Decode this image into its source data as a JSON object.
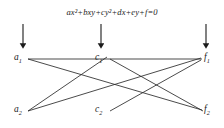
{
  "figure": {
    "equation": "ax²+bxy+cy²+dx+ey+f=0",
    "background_color": "#ffffff",
    "ink_color": "#1b1b1b",
    "nodes": [
      {
        "id": "a1",
        "label_base": "a",
        "label_sub": "1",
        "x": 20,
        "y": 57
      },
      {
        "id": "a2",
        "label_base": "a",
        "label_sub": "2",
        "x": 20,
        "y": 109
      },
      {
        "id": "c1",
        "label_base": "c",
        "label_sub": "1",
        "x": 101,
        "y": 57
      },
      {
        "id": "c2",
        "label_base": "c",
        "label_sub": "2",
        "x": 101,
        "y": 109
      },
      {
        "id": "f1",
        "label_base": "f",
        "label_sub": "1",
        "x": 208,
        "y": 57
      },
      {
        "id": "f2",
        "label_base": "f",
        "label_sub": "2",
        "x": 208,
        "y": 109
      }
    ],
    "arrows": [
      {
        "id": "arrow-a",
        "x": 23,
        "y_start": 24,
        "y_end": 47
      },
      {
        "id": "arrow-c",
        "x": 101,
        "y_start": 24,
        "y_end": 47
      },
      {
        "id": "arrow-f",
        "x": 206,
        "y_start": 24,
        "y_end": 47
      }
    ],
    "edges": [
      {
        "id": "edge-a1-f1",
        "from": "a1",
        "to": "f1",
        "x1": 28,
        "y1": 59,
        "x2": 202,
        "y2": 59
      },
      {
        "id": "edge-a1-f2",
        "from": "a1",
        "to": "f2",
        "x1": 28,
        "y1": 59,
        "x2": 202,
        "y2": 110
      },
      {
        "id": "edge-a2-c1",
        "from": "a2",
        "to": "c1",
        "x1": 28,
        "y1": 111,
        "x2": 107,
        "y2": 57
      },
      {
        "id": "edge-a2-f1",
        "from": "a2",
        "to": "f1",
        "x1": 28,
        "y1": 111,
        "x2": 201,
        "y2": 58
      },
      {
        "id": "edge-c1-f2",
        "from": "c1",
        "to": "f2",
        "x1": 110,
        "y1": 59,
        "x2": 203,
        "y2": 111
      },
      {
        "id": "edge-c2-f1",
        "from": "c2",
        "to": "f1",
        "x1": 110,
        "y1": 111,
        "x2": 201,
        "y2": 60
      }
    ]
  }
}
